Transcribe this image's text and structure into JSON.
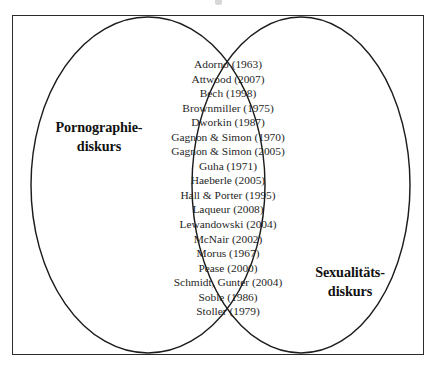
{
  "diagram": {
    "type": "venn",
    "title": "",
    "sets": [
      {
        "id": "pornographie-diskurs",
        "label_lines": [
          "Pornographie-",
          "diskurs"
        ],
        "label_full": "Pornographie-diskurs",
        "position": "left"
      },
      {
        "id": "sexualitaets-diskurs",
        "label_lines": [
          "Sexualitäts-",
          "diskurs"
        ],
        "label_full": "Sexualitäts-diskurs",
        "position": "right"
      }
    ],
    "intersection": {
      "count": 18,
      "entries": [
        "Adorno (1963)",
        "Attwood (2007)",
        "Bech (1998)",
        "Brownmiller (1975)",
        "Dworkin (1987)",
        "Gagnon & Simon (1970)",
        "Gagnon & Simon (2005)",
        "Guha (1971)",
        "Haeberle (2005)",
        "Hall & Porter (1995)",
        "Laqueur (2008)",
        "Lewandowski (2004)",
        "McNair (2002)",
        "Morus (1967)",
        "Pease (2000)",
        "Schmidt, Gunter (2004)",
        "Soble (1986)",
        "Stoller (1979)"
      ]
    },
    "colors": {
      "stroke": "#1c1c1c",
      "frame": "#2b2b2b",
      "text": "#1f1f1f",
      "label_text": "#111111",
      "background": "#ffffff"
    }
  }
}
